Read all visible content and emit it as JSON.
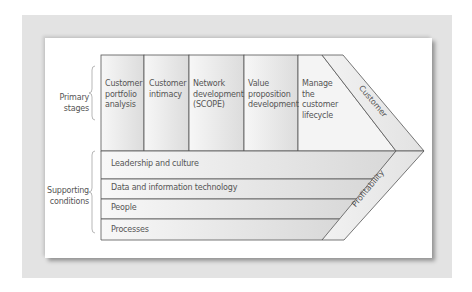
{
  "diagram": {
    "groups": {
      "primary": "Primary stages",
      "primary_lines": [
        "Primary",
        "stages"
      ],
      "supporting": "Supporting conditions",
      "supporting_lines": [
        "Supporting",
        "conditions"
      ]
    },
    "primary_stages": [
      {
        "label": "Customer portfolio analysis",
        "lines": [
          "Customer",
          "portfolio",
          "analysis"
        ]
      },
      {
        "label": "Customer intimacy",
        "lines": [
          "Customer",
          "intimacy"
        ]
      },
      {
        "label": "Network development (SCOPE)",
        "lines": [
          "Network",
          "development",
          "(SCOPE)"
        ]
      },
      {
        "label": "Value proposition development",
        "lines": [
          "Value",
          "proposition",
          "development"
        ]
      },
      {
        "label": "Manage the customer lifecycle",
        "lines": [
          "Manage",
          "the",
          "customer",
          "lifecycle"
        ]
      }
    ],
    "supporting_conditions": [
      "Leadership and culture",
      "Data and information technology",
      "People",
      "Processes"
    ],
    "outcomes": {
      "top": "Customer",
      "bottom": "Profitability"
    },
    "colors": {
      "outer_bg": "#e3e3e3",
      "panel_bg": "#ffffff",
      "box_fill": "#e6e6e6",
      "stroke": "#555555",
      "text": "#555555"
    }
  }
}
